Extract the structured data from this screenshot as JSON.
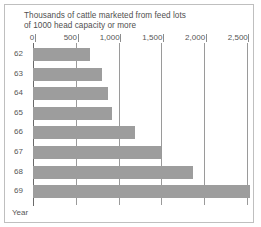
{
  "chart_data": {
    "type": "bar",
    "orientation": "horizontal",
    "title": "Thousands of cattle marketed from feed lots\nof 1000 head capacity or more",
    "title_line1": "Thousands of cattle marketed from feed lots",
    "title_line2": "of 1000 head capacity or more",
    "xlabel": "",
    "ylabel": "Year",
    "categories": [
      "62",
      "63",
      "64",
      "65",
      "66",
      "67",
      "68",
      "69"
    ],
    "values": [
      660,
      800,
      880,
      920,
      1190,
      1500,
      1875,
      2540
    ],
    "xlim": [
      0,
      2700
    ],
    "xticks": [
      0,
      500,
      1000,
      1500,
      2000,
      2500
    ],
    "xtick_labels": [
      "0",
      "500",
      "1,000",
      "1,500",
      "2,000",
      "2,500"
    ],
    "grid": true,
    "legend": null,
    "bar_color": "#9d9d9d",
    "grid_color": "#9a9a9a",
    "axis_color": "#6a6a6a",
    "text_color": "#565656"
  },
  "axis": {
    "year_label": "Year"
  }
}
